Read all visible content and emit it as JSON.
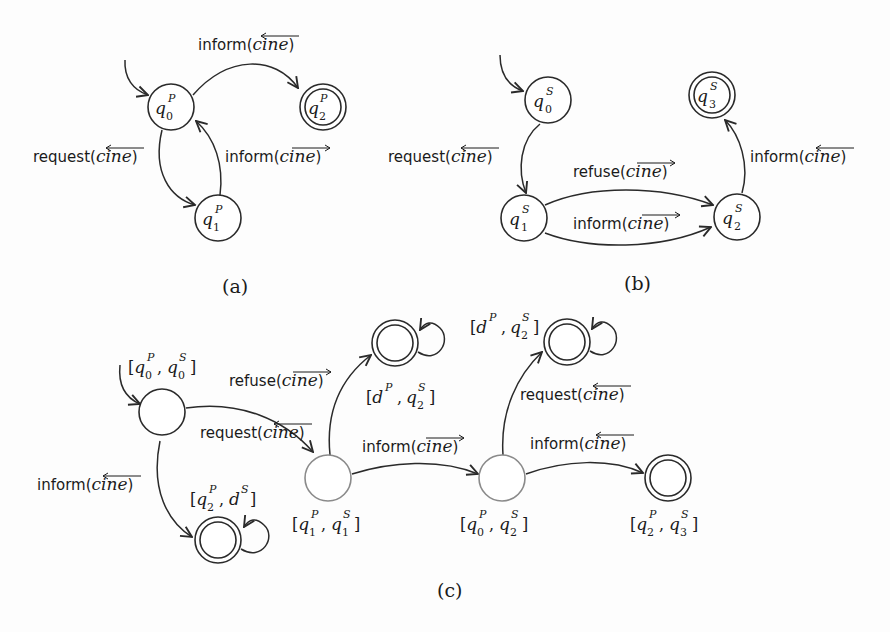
{
  "figure": {
    "a": {
      "caption": "(a)",
      "states": [
        {
          "id": "q0P",
          "base": "q",
          "sup": "P",
          "sub": "0",
          "initial": true,
          "final": false
        },
        {
          "id": "q1P",
          "base": "q",
          "sup": "P",
          "sub": "1",
          "initial": false,
          "final": false
        },
        {
          "id": "q2P",
          "base": "q",
          "sup": "P",
          "sub": "2",
          "initial": false,
          "final": true
        }
      ],
      "transitions": [
        {
          "from": "q0P",
          "to": "q2P",
          "action": "inform",
          "arg": "cine",
          "direction": "left"
        },
        {
          "from": "q0P",
          "to": "q1P",
          "action": "request",
          "arg": "cine",
          "direction": "left"
        },
        {
          "from": "q1P",
          "to": "q0P",
          "action": "inform",
          "arg": "cine",
          "direction": "right"
        }
      ]
    },
    "b": {
      "caption": "(b)",
      "states": [
        {
          "id": "q0S",
          "base": "q",
          "sup": "S",
          "sub": "0",
          "initial": true,
          "final": false
        },
        {
          "id": "q1S",
          "base": "q",
          "sup": "S",
          "sub": "1",
          "initial": false,
          "final": false
        },
        {
          "id": "q2S",
          "base": "q",
          "sup": "S",
          "sub": "2",
          "initial": false,
          "final": false
        },
        {
          "id": "q3S",
          "base": "q",
          "sup": "S",
          "sub": "3",
          "initial": false,
          "final": true
        }
      ],
      "transitions": [
        {
          "from": "q0S",
          "to": "q1S",
          "action": "request",
          "arg": "cine",
          "direction": "left"
        },
        {
          "from": "q1S",
          "to": "q2S",
          "action": "refuse",
          "arg": "cine",
          "direction": "right"
        },
        {
          "from": "q1S",
          "to": "q2S",
          "action": "inform",
          "arg": "cine",
          "direction": "right"
        },
        {
          "from": "q2S",
          "to": "q3S",
          "action": "inform",
          "arg": "cine",
          "direction": "left"
        }
      ]
    },
    "c": {
      "caption": "(c)",
      "states": [
        {
          "id": "c00",
          "label": "[q0P, q0S]",
          "initial": true,
          "final": false,
          "gray": false
        },
        {
          "id": "c11",
          "label": "[q1P, q1S]",
          "initial": false,
          "final": false,
          "gray": true
        },
        {
          "id": "c02",
          "label": "[q0P, q2S]",
          "initial": false,
          "final": false,
          "gray": true
        },
        {
          "id": "cd2a",
          "label": "[dP, q2S]",
          "initial": false,
          "final": true,
          "selfloop": true
        },
        {
          "id": "c2d",
          "label": "[q2P, dS]",
          "initial": false,
          "final": true,
          "selfloop": true
        },
        {
          "id": "cd2b",
          "label": "[dP, q2S]",
          "initial": false,
          "final": true,
          "selfloop": true
        },
        {
          "id": "c23",
          "label": "[q2P, q3S]",
          "initial": false,
          "final": true,
          "selfloop": false
        }
      ],
      "transitions": [
        {
          "from": "c00",
          "to": "c11",
          "action": "request",
          "arg": "cine",
          "direction": "left"
        },
        {
          "from": "c00",
          "to": "c2d",
          "action": "inform",
          "arg": "cine",
          "direction": "left"
        },
        {
          "from": "c11",
          "to": "cd2a",
          "action": "refuse",
          "arg": "cine",
          "direction": "right"
        },
        {
          "from": "c11",
          "to": "c02",
          "action": "inform",
          "arg": "cine",
          "direction": "right"
        },
        {
          "from": "c02",
          "to": "cd2b",
          "action": "request",
          "arg": "cine",
          "direction": "left"
        },
        {
          "from": "c02",
          "to": "c23",
          "action": "inform",
          "arg": "cine",
          "direction": "left"
        }
      ]
    }
  },
  "text": {
    "inform": "inform(",
    "request": "request(",
    "refuse": "refuse(",
    "cine": "cine",
    "close": ")",
    "q": "q",
    "d": "d",
    "P": "P",
    "S": "S",
    "n0": "0",
    "n1": "1",
    "n2": "2",
    "n3": "3",
    "lb": "[",
    "rb": "]",
    "comma": ",",
    "cap_a": "(a)",
    "cap_b": "(b)",
    "cap_c": "(c)"
  },
  "colors": {
    "stroke": "#2a2a2a",
    "gray_state": "#8a8a8a",
    "background": "#fdfdfd"
  }
}
